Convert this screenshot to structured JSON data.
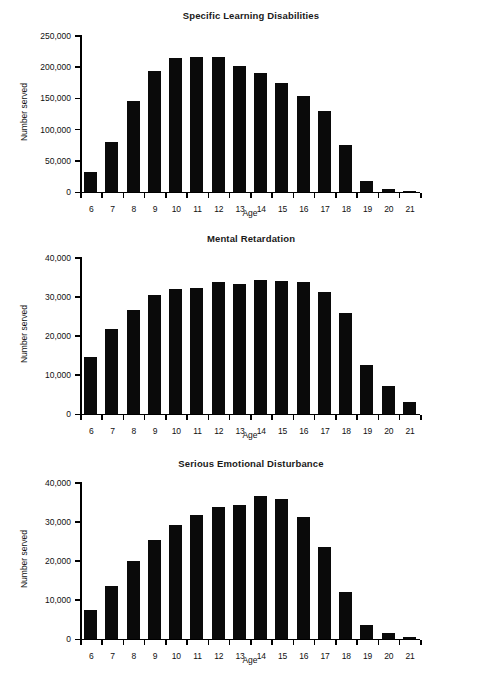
{
  "figure": {
    "background": "#ffffff",
    "bar_color": "#0a0a0a",
    "axis_color": "#000000"
  },
  "charts": [
    {
      "id": "specific-learning-disabilities",
      "title": "Specific Learning Disabilities",
      "xlabel": "Age",
      "ylabel": "Number served",
      "ytick_labels": [
        "0",
        "50,000",
        "100,000",
        "150,000",
        "200,000",
        "250,000"
      ]
    },
    {
      "id": "mental-retardation",
      "title": "Mental Retardation",
      "xlabel": "Age",
      "ylabel": "Number served",
      "ytick_labels": [
        "0",
        "10,000",
        "20,000",
        "30,000",
        "40,000"
      ]
    },
    {
      "id": "serious-emotional-disturbance",
      "title": "Serious Emotional Disturbance",
      "xlabel": "Age",
      "ylabel": "Number served",
      "ytick_labels": [
        "0",
        "10,000",
        "20,000",
        "30,000",
        "40,000"
      ]
    }
  ],
  "chart_data": [
    {
      "type": "bar",
      "title": "Specific Learning Disabilities",
      "xlabel": "Age",
      "ylabel": "Number served",
      "categories": [
        "6",
        "7",
        "8",
        "9",
        "10",
        "11",
        "12",
        "13",
        "14",
        "15",
        "16",
        "17",
        "18",
        "19",
        "20",
        "21"
      ],
      "values": [
        31000,
        79000,
        144000,
        192000,
        213000,
        215000,
        215000,
        200000,
        190000,
        173000,
        153000,
        128000,
        74000,
        16000,
        4000,
        1500
      ],
      "ylim": [
        0,
        250000
      ],
      "yticks": [
        0,
        50000,
        100000,
        150000,
        200000,
        250000
      ],
      "ytick_labels": [
        "0",
        "50,000",
        "100,000",
        "150,000",
        "200,000",
        "250,000"
      ],
      "grid": false,
      "legend": "none"
    },
    {
      "type": "bar",
      "title": "Mental Retardation",
      "xlabel": "Age",
      "ylabel": "Number served",
      "categories": [
        "6",
        "7",
        "8",
        "9",
        "10",
        "11",
        "12",
        "13",
        "14",
        "15",
        "16",
        "17",
        "18",
        "19",
        "20",
        "21"
      ],
      "values": [
        14500,
        21500,
        26500,
        30300,
        31900,
        32200,
        33600,
        33200,
        34000,
        33800,
        33500,
        31000,
        25800,
        12500,
        7100,
        3000
      ],
      "ylim": [
        0,
        40000
      ],
      "yticks": [
        0,
        10000,
        20000,
        30000,
        40000
      ],
      "ytick_labels": [
        "0",
        "10,000",
        "20,000",
        "30,000",
        "40,000"
      ],
      "grid": false,
      "legend": "none"
    },
    {
      "type": "bar",
      "title": "Serious Emotional Disturbance",
      "xlabel": "Age",
      "ylabel": "Number served",
      "categories": [
        "6",
        "7",
        "8",
        "9",
        "10",
        "11",
        "12",
        "13",
        "14",
        "15",
        "16",
        "17",
        "18",
        "19",
        "20",
        "21"
      ],
      "values": [
        7200,
        13400,
        19700,
        25200,
        29100,
        31500,
        33600,
        34200,
        36400,
        35600,
        31000,
        23300,
        11900,
        3400,
        1300,
        400
      ],
      "ylim": [
        0,
        40000
      ],
      "yticks": [
        0,
        10000,
        20000,
        30000,
        40000
      ],
      "ytick_labels": [
        "0",
        "10,000",
        "20,000",
        "30,000",
        "40,000"
      ],
      "grid": false,
      "legend": "none"
    }
  ]
}
